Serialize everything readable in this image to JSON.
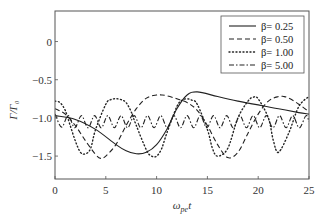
{
  "chart_data": {
    "type": "line",
    "title": "",
    "xlabel": "ω_pe t",
    "xlabel_main": "ω",
    "xlabel_sub": "pe",
    "xlabel_tail": "t",
    "ylabel": "Γ/Γ₀",
    "xlim": [
      0,
      25
    ],
    "ylim": [
      -1.8,
      0.4
    ],
    "xticks": [
      0,
      5,
      10,
      15,
      20,
      25
    ],
    "xtick_labels": [
      "0",
      "5",
      "10",
      "15",
      "20",
      "25"
    ],
    "yticks": [
      0,
      -0.5,
      -1.0,
      -1.5
    ],
    "ytick_labels": [
      "0",
      "−0.5",
      "−1.0",
      "−1.5"
    ],
    "grid": false,
    "legend_position": "upper right",
    "series": [
      {
        "name": "β = 0.25",
        "label": "β= 0.25",
        "style": "solid",
        "x": [
          0,
          2,
          4,
          6,
          7,
          8,
          9,
          10,
          11,
          12,
          13,
          14,
          16,
          18,
          20,
          22,
          24,
          25
        ],
        "y": [
          -0.97,
          -1.02,
          -1.15,
          -1.35,
          -1.43,
          -1.47,
          -1.45,
          -1.35,
          -1.15,
          -0.88,
          -0.7,
          -0.66,
          -0.72,
          -0.78,
          -0.83,
          -0.88,
          -0.93,
          -0.95
        ]
      },
      {
        "name": "β = 0.50",
        "label": "β= 0.50",
        "style": "dashed",
        "x": [
          0,
          1,
          2,
          3,
          4,
          4.5,
          5,
          6,
          7,
          8,
          9,
          10,
          10.5,
          11,
          12,
          13,
          14,
          15,
          16,
          17,
          18,
          19,
          20,
          21,
          22,
          22.5,
          23,
          24,
          25
        ],
        "y": [
          -0.88,
          -0.95,
          -1.1,
          -1.3,
          -1.48,
          -1.53,
          -1.5,
          -1.35,
          -1.1,
          -0.88,
          -0.74,
          -0.7,
          -0.7,
          -0.71,
          -0.75,
          -0.8,
          -0.9,
          -1.1,
          -1.35,
          -1.52,
          -1.45,
          -1.2,
          -0.95,
          -0.78,
          -0.72,
          -0.72,
          -0.74,
          -0.82,
          -0.92
        ]
      },
      {
        "name": "β = 1.00",
        "label": "β= 1.00",
        "style": "dotted",
        "x": [
          0,
          0.5,
          1,
          1.5,
          2,
          2.5,
          3,
          3.5,
          4,
          5,
          5.5,
          6,
          6.5,
          7,
          7.5,
          8,
          9,
          9.5,
          10,
          10.5,
          11,
          12,
          12.5,
          13,
          13.5,
          14,
          15,
          15.5,
          16,
          17,
          18,
          19,
          19.5,
          20,
          21,
          21.5,
          22,
          23,
          24,
          25
        ],
        "y": [
          -0.78,
          -0.8,
          -0.9,
          -1.1,
          -1.3,
          -1.45,
          -1.47,
          -1.4,
          -1.15,
          -0.82,
          -0.76,
          -0.75,
          -0.76,
          -0.8,
          -0.92,
          -1.1,
          -1.42,
          -1.5,
          -1.5,
          -1.4,
          -1.2,
          -0.85,
          -0.77,
          -0.75,
          -0.77,
          -0.82,
          -1.15,
          -1.4,
          -1.5,
          -1.4,
          -1.0,
          -0.78,
          -0.73,
          -0.75,
          -1.0,
          -1.3,
          -1.45,
          -1.2,
          -0.85,
          -0.72
        ]
      },
      {
        "name": "β = 5.00",
        "label": "β= 5.00",
        "style": "dash-dot",
        "mean": -1.05,
        "amplitude": 0.08,
        "period": 1.3,
        "x": [
          0,
          0.65,
          1.3,
          1.95,
          2.6,
          3.25,
          3.9,
          4.55,
          5.2,
          5.85,
          6.5,
          7.15,
          7.8,
          8.45,
          9.1,
          9.75,
          10.4,
          11.05,
          11.7,
          12.35,
          13.0,
          13.65,
          14.3,
          14.95,
          15.6,
          16.25,
          16.9,
          17.55,
          18.2,
          18.85,
          19.5,
          20.15,
          20.8,
          21.45,
          22.1,
          22.75,
          23.4,
          24.05,
          24.7,
          25
        ],
        "y": [
          -0.95,
          -1.12,
          -0.97,
          -1.13,
          -0.97,
          -1.13,
          -0.97,
          -1.13,
          -0.97,
          -1.13,
          -0.97,
          -1.13,
          -0.97,
          -1.13,
          -0.97,
          -1.13,
          -0.97,
          -1.13,
          -0.97,
          -1.13,
          -0.97,
          -1.13,
          -0.97,
          -1.13,
          -0.97,
          -1.13,
          -0.97,
          -1.13,
          -0.97,
          -1.13,
          -0.97,
          -1.13,
          -0.97,
          -1.13,
          -0.97,
          -1.13,
          -0.97,
          -1.13,
          -0.97,
          -1.05
        ]
      }
    ]
  }
}
